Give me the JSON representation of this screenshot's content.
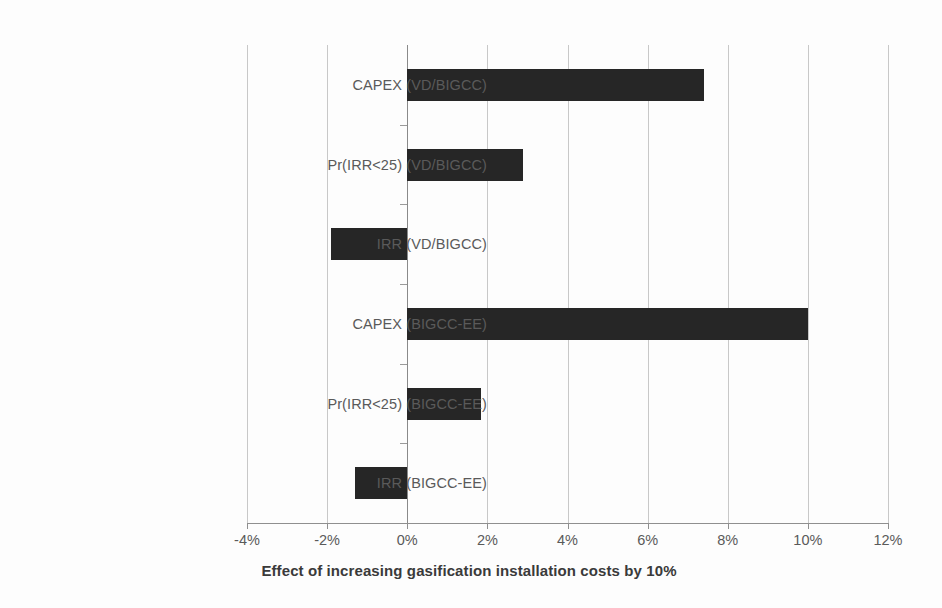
{
  "chart_data": {
    "type": "bar",
    "orientation": "horizontal",
    "title": "",
    "xlabel": "Effect of increasing gasification installation costs by 10%",
    "ylabel": "",
    "categories": [
      "CAPEX (VD/BIGCC)",
      "Pr(IRR<25)  (VD/BIGCC)",
      "IRR (VD/BIGCC)",
      "CAPEX (BIGCC-EE)",
      "Pr(IRR<25)  (BIGCC-EE)",
      "IRR (BIGCC-EE)"
    ],
    "values": [
      7.4,
      2.9,
      -1.9,
      10.0,
      1.85,
      -1.3
    ],
    "value_unit": "%",
    "xlim": [
      -4,
      12
    ],
    "xticks": [
      -4,
      -2,
      0,
      2,
      4,
      6,
      8,
      10,
      12
    ],
    "xtick_labels": [
      "-4%",
      "-2%",
      "0%",
      "2%",
      "4%",
      "6%",
      "8%",
      "10%",
      "12%"
    ],
    "grid": true,
    "grid_axis": "x",
    "legend": false,
    "bar_color": "#262626",
    "gridline_color": "#c8c8c8",
    "axis_color": "#8f8f8f",
    "label_color": "#5a5a5a"
  }
}
